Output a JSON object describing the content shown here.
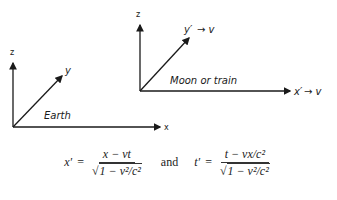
{
  "diagram": {
    "earth_frame": {
      "label": "Earth",
      "axes": {
        "z": "z",
        "y": "y",
        "x": "x"
      }
    },
    "moving_frame": {
      "label": "Moon or train",
      "axes": {
        "z": "z",
        "y": "y′",
        "x": "x′"
      },
      "velocity_label_y": "→ v",
      "velocity_label_x": "→ v"
    },
    "equations": {
      "x_lhs": "x′",
      "x_num": "x − vt",
      "t_lhs": "t′",
      "t_num": "t − vx/c²",
      "den_prefix": "√",
      "den_body": "1 − v²/c²",
      "equals": "=",
      "conjunction": "and"
    }
  }
}
